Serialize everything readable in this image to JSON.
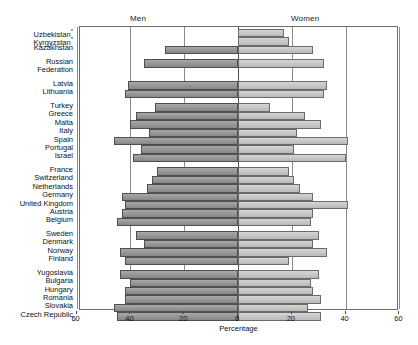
{
  "chart": {
    "panels": {
      "left_title": "Men",
      "right_title": "Women"
    },
    "xlabel": "Percentage",
    "x_ticks_left": [
      "60",
      "40",
      "20",
      "0"
    ],
    "x_ticks_right": [
      "20",
      "40",
      "60"
    ],
    "footnote_marker": "*"
  },
  "chart_data": {
    "type": "bar",
    "subtype": "population-pyramid",
    "title": "",
    "xlabel": "Percentage",
    "ylabel": "",
    "xlim": [
      -60,
      60
    ],
    "xticks": [
      -60,
      -40,
      -20,
      0,
      20,
      40,
      60
    ],
    "xticklabels": [
      "60",
      "40",
      "20",
      "0",
      "20",
      "40",
      "60"
    ],
    "grid": true,
    "legend": [
      "Men",
      "Women"
    ],
    "legend_position": "panel-headers",
    "categories": [
      "Uzbekistan*",
      "Kyrgyzstan*",
      "Kazakhstan",
      "Russian Federation",
      "Latvia",
      "Lithuania",
      "Turkey",
      "Greece",
      "Malta",
      "Italy",
      "Spain",
      "Portugal",
      "Israel",
      "France",
      "Switzerland",
      "Netherlands",
      "Germany",
      "United Kingdom",
      "Austria",
      "Belgium",
      "Sweden",
      "Denmark",
      "Norway",
      "Finland",
      "Yugoslavia",
      "Bulgaria",
      "Hungary",
      "Romania",
      "Slovakia",
      "Czech Republic"
    ],
    "series": [
      {
        "name": "Men",
        "values": [
          0,
          0,
          27,
          35,
          41,
          42,
          31,
          38,
          40,
          33,
          46,
          36,
          39,
          30,
          32,
          34,
          43,
          42,
          43,
          45,
          38,
          35,
          44,
          42,
          44,
          40,
          42,
          42,
          46,
          45
        ]
      },
      {
        "name": "Women",
        "values": [
          17,
          19,
          28,
          32,
          33,
          32,
          12,
          25,
          31,
          22,
          41,
          21,
          40,
          19,
          21,
          23,
          28,
          41,
          28,
          27,
          30,
          28,
          33,
          19,
          30,
          27,
          28,
          31,
          26,
          31
        ]
      }
    ]
  },
  "rows": [
    {
      "label": "Uzbekistan",
      "sup": "*",
      "men": 0,
      "women": 17
    },
    {
      "label": "Kyrgyzstan",
      "sup": "*",
      "men": 0,
      "women": 19
    },
    {
      "label": "Kazakhstan",
      "sup": "",
      "men": 27,
      "women": 28
    },
    {
      "label": "Russian",
      "sup": "",
      "men": 35,
      "women": 32,
      "spacer_before": true,
      "hidden_bars": true
    },
    {
      "label": "Federation",
      "sup": "",
      "men": 35,
      "women": 32
    },
    {
      "label": "Latvia",
      "sup": "",
      "men": 41,
      "women": 33
    },
    {
      "label": "Lithuania",
      "sup": "",
      "men": 42,
      "women": 32
    },
    {
      "label": "Turkey",
      "sup": "",
      "men": 31,
      "women": 12
    },
    {
      "label": "Greece",
      "sup": "",
      "men": 38,
      "women": 25
    },
    {
      "label": "Malta",
      "sup": "",
      "men": 40,
      "women": 31
    },
    {
      "label": "Italy",
      "sup": "",
      "men": 33,
      "women": 22
    },
    {
      "label": "Spain",
      "sup": "",
      "men": 46,
      "women": 41
    },
    {
      "label": "Portugal",
      "sup": "",
      "men": 36,
      "women": 21
    },
    {
      "label": "Israel",
      "sup": "",
      "men": 39,
      "women": 40
    },
    {
      "label": "France",
      "sup": "",
      "men": 30,
      "women": 19
    },
    {
      "label": "Switzerland",
      "sup": "",
      "men": 32,
      "women": 21
    },
    {
      "label": "Netherlands",
      "sup": "",
      "men": 34,
      "women": 23
    },
    {
      "label": "Germany",
      "sup": "",
      "men": 43,
      "women": 28
    },
    {
      "label": "United Kingdom",
      "sup": "",
      "men": 42,
      "women": 41
    },
    {
      "label": "Austria",
      "sup": "",
      "men": 43,
      "women": 28
    },
    {
      "label": "Belgium",
      "sup": "",
      "men": 45,
      "women": 27
    },
    {
      "label": "Sweden",
      "sup": "",
      "men": 38,
      "women": 30
    },
    {
      "label": "Denmark",
      "sup": "",
      "men": 35,
      "women": 28
    },
    {
      "label": "Norway",
      "sup": "",
      "men": 44,
      "women": 33
    },
    {
      "label": "Finland",
      "sup": "",
      "men": 42,
      "women": 19
    },
    {
      "label": "Yugoslavia",
      "sup": "",
      "men": 44,
      "women": 30
    },
    {
      "label": "Bulgaria",
      "sup": "",
      "men": 40,
      "women": 27
    },
    {
      "label": "Hungary",
      "sup": "",
      "men": 42,
      "women": 28
    },
    {
      "label": "Romania",
      "sup": "",
      "men": 42,
      "women": 31
    },
    {
      "label": "Slovakia",
      "sup": "",
      "men": 46,
      "women": 26
    },
    {
      "label": "Czech Republic",
      "sup": "",
      "men": 45,
      "women": 31
    }
  ],
  "colors": {
    "men_bar": "#8f8f8f",
    "women_bar": "#c3c3c3",
    "bar_border": "#4f4f4f",
    "grid": "#8a8a8a",
    "axis": "#6d6d6d",
    "text": "#1a1a1a"
  }
}
